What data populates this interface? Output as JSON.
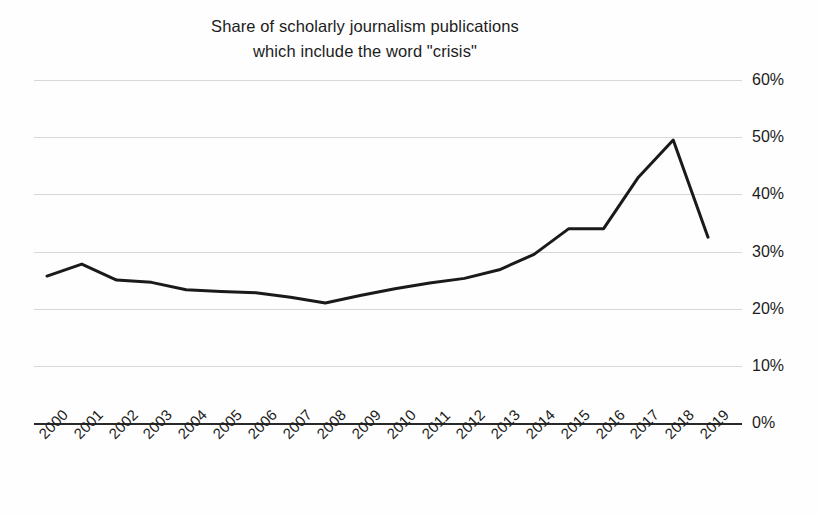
{
  "chart_data": {
    "type": "line",
    "title": "Share of scholarly journalism publications which include the word \"crisis\"",
    "title_lines": [
      "Share of scholarly journalism publications",
      "which include the word \"crisis\""
    ],
    "xlabel": "",
    "ylabel": "",
    "ylim": [
      0,
      60
    ],
    "ytick_values": [
      60,
      50,
      40,
      30,
      20,
      10,
      0
    ],
    "ytick_labels": [
      "60%",
      "50%",
      "40%",
      "30%",
      "20%",
      "10%",
      "0%"
    ],
    "grid": true,
    "grid_axis": "y",
    "legend": false,
    "legend_position": "none",
    "line_color": "#1a1a1a",
    "line_width": 3,
    "categories": [
      "2000",
      "2001",
      "2002",
      "2003",
      "2004",
      "2005",
      "2006",
      "2007",
      "2008",
      "2009",
      "2010",
      "2011",
      "2012",
      "2013",
      "2014",
      "2015",
      "2016",
      "2017",
      "2018",
      "2019"
    ],
    "x": [
      2000,
      2001,
      2002,
      2003,
      2004,
      2005,
      2006,
      2007,
      2008,
      2009,
      2010,
      2011,
      2012,
      2013,
      2014,
      2015,
      2016,
      2017,
      2018,
      2019
    ],
    "values": [
      25.7,
      27.8,
      25.0,
      24.6,
      23.3,
      23.0,
      22.8,
      22.0,
      21.0,
      22.3,
      23.5,
      24.5,
      25.3,
      26.8,
      29.5,
      34.0,
      34.0,
      43.0,
      49.5,
      32.5
    ],
    "series": [
      {
        "name": "Share of publications including \"crisis\"",
        "values": [
          25.7,
          27.8,
          25.0,
          24.6,
          23.3,
          23.0,
          22.8,
          22.0,
          21.0,
          22.3,
          23.5,
          24.5,
          25.3,
          26.8,
          29.5,
          34.0,
          34.0,
          43.0,
          49.5,
          32.5
        ]
      }
    ],
    "units": "percent"
  }
}
